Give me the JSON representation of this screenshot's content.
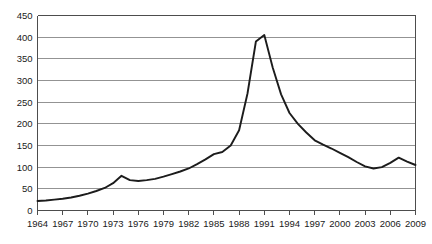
{
  "chart_data": {
    "type": "line",
    "title": "",
    "subtitle": "",
    "xlabel": "",
    "ylabel": "",
    "xlim": [
      1964,
      2009
    ],
    "ylim": [
      0,
      450
    ],
    "grid": true,
    "legend": null,
    "legend_position": "none",
    "line_color": "#1c1c1c",
    "grid_color": "#878787",
    "axis_color": "#4d4d4d",
    "background": "#ffffff",
    "y_ticks": [
      0,
      50,
      100,
      150,
      200,
      250,
      300,
      350,
      400,
      450
    ],
    "y_tick_labels": [
      "0",
      "50",
      "100",
      "150",
      "200",
      "250",
      "300",
      "350",
      "400",
      "450"
    ],
    "x_ticks": [
      1964,
      1967,
      1970,
      1973,
      1976,
      1979,
      1982,
      1985,
      1988,
      1991,
      1994,
      1997,
      2000,
      2003,
      2006,
      2009
    ],
    "x_tick_labels": [
      "1964",
      "1967",
      "1970",
      "1973",
      "1976",
      "1979",
      "1982",
      "1985",
      "1988",
      "1991",
      "1994",
      "1997",
      "2000",
      "2003",
      "2006",
      "2009"
    ],
    "x": [
      1964,
      1965,
      1966,
      1967,
      1968,
      1969,
      1970,
      1971,
      1972,
      1973,
      1974,
      1975,
      1976,
      1977,
      1978,
      1979,
      1980,
      1981,
      1982,
      1983,
      1984,
      1985,
      1986,
      1987,
      1988,
      1989,
      1990,
      1991,
      1992,
      1993,
      1994,
      1995,
      1996,
      1997,
      1998,
      1999,
      2000,
      2001,
      2002,
      2003,
      2004,
      2005,
      2006,
      2007,
      2008,
      2009
    ],
    "values": [
      22,
      23,
      25,
      27,
      30,
      34,
      39,
      45,
      52,
      63,
      80,
      70,
      68,
      70,
      73,
      78,
      84,
      90,
      97,
      107,
      118,
      130,
      135,
      150,
      185,
      270,
      390,
      405,
      330,
      268,
      225,
      200,
      180,
      162,
      152,
      143,
      133,
      123,
      112,
      102,
      97,
      100,
      110,
      122,
      113,
      105
    ],
    "series": [
      {
        "name": "series-1",
        "values": [
          22,
          23,
          25,
          27,
          30,
          34,
          39,
          45,
          52,
          63,
          80,
          70,
          68,
          70,
          73,
          78,
          84,
          90,
          97,
          107,
          118,
          130,
          135,
          150,
          185,
          270,
          390,
          405,
          330,
          268,
          225,
          200,
          180,
          162,
          152,
          143,
          133,
          123,
          112,
          102,
          97,
          100,
          110,
          122,
          113,
          105
        ]
      }
    ],
    "annotations": []
  },
  "figure": {
    "name": "line-chart"
  }
}
